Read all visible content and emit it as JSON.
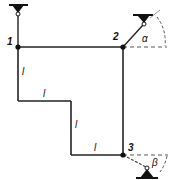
{
  "diagram": {
    "type": "structural-frame",
    "nodes": [
      {
        "id": "1",
        "label": "1"
      },
      {
        "id": "2",
        "label": "2"
      },
      {
        "id": "3",
        "label": "3"
      }
    ],
    "member_labels": [
      "l",
      "l",
      "l",
      "l"
    ],
    "angles": {
      "alpha": "α",
      "beta": "β"
    },
    "supports": [
      {
        "at": "1",
        "orientation": "vertical-top"
      },
      {
        "at": "2",
        "orientation": "inclined",
        "angle": "α"
      },
      {
        "at": "3",
        "orientation": "inclined",
        "angle": "β"
      }
    ]
  }
}
